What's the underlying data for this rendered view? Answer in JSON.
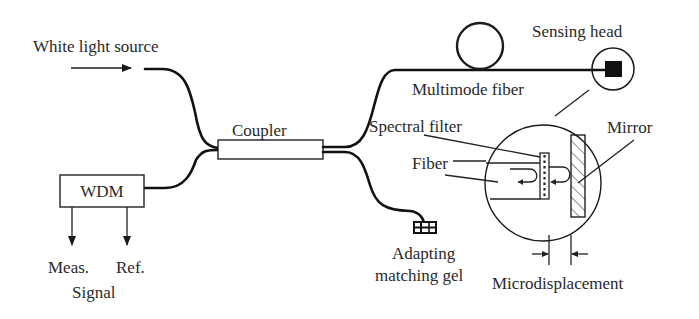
{
  "diagram": {
    "type": "optical fiber sensor schematic",
    "labels": {
      "source": "White light source",
      "coupler": "Coupler",
      "wdm": "WDM",
      "meas": "Meas.",
      "ref": "Ref.",
      "signal": "Signal",
      "multimode_fiber": "Multimode fiber",
      "sensing_head": "Sensing head",
      "spectral_filter": "Spectral filter",
      "fiber": "Fiber",
      "mirror": "Mirror",
      "gel_line1": "Adapting",
      "gel_line2": "matching gel",
      "microdisplacement": "Microdisplacement"
    },
    "components": [
      {
        "id": "source",
        "label": "White light source"
      },
      {
        "id": "coupler",
        "label": "Coupler"
      },
      {
        "id": "wdm",
        "label": "WDM",
        "outputs": [
          "Meas.",
          "Ref."
        ],
        "output_group": "Signal"
      },
      {
        "id": "multimode_fiber",
        "label": "Multimode fiber",
        "has_loop": true
      },
      {
        "id": "sensing_head",
        "label": "Sensing head"
      },
      {
        "id": "gel",
        "label": "Adapting matching gel"
      },
      {
        "id": "detail_view",
        "parts": [
          "Spectral filter",
          "Fiber",
          "Mirror"
        ],
        "dimension": "Microdisplacement"
      }
    ],
    "colors": {
      "ink": "#1a1a1a",
      "text": "#2a2a2a",
      "background": "#ffffff"
    }
  }
}
